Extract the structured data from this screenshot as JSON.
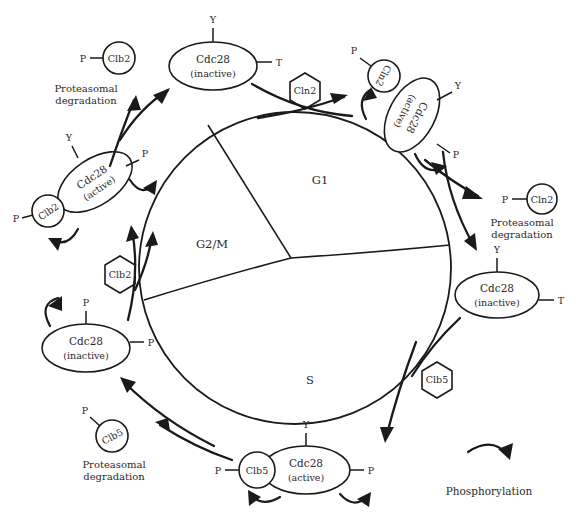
{
  "figure": {
    "ink_color": "#1a1a1a",
    "text_color": "#2a2a2a",
    "background": "#ffffff"
  },
  "cycle": {
    "phases": [
      {
        "label": "G1"
      },
      {
        "label": "S"
      },
      {
        "label": "G2/M"
      }
    ]
  },
  "cyclin_inputs": [
    {
      "label": "Cln2",
      "shape": "hexagon"
    },
    {
      "label": "Clb5",
      "shape": "hexagon"
    },
    {
      "label": "Clb2",
      "shape": "hexagon"
    }
  ],
  "nodes": {
    "g1_inactive_cdc28": {
      "name": "Cdc28",
      "state": "(inactive)",
      "residue_top": "Y",
      "residue_right": "T"
    },
    "g1_active_complex": {
      "name": "Cdc28",
      "state": "(active)",
      "cyclin": "Cln2",
      "cyclin_phosphate": "P",
      "residue_top": "Y",
      "residue_bottom": "P"
    },
    "cln2_degraded": {
      "cyclin": "Cln2",
      "phosphate": "P"
    },
    "s_inactive_cdc28": {
      "name": "Cdc28",
      "state": "(inactive)",
      "residue_top": "Y",
      "residue_right": "T"
    },
    "s_active_complex": {
      "name": "Cdc28",
      "state": "(active)",
      "cyclin": "Clb5",
      "cyclin_phosphate": "P",
      "residue_top": "Y",
      "residue_right": "P"
    },
    "clb5_degraded": {
      "cyclin": "Clb5",
      "phosphate": "P"
    },
    "g2m_inactive_cdc28": {
      "name": "Cdc28",
      "state": "(inactive)",
      "residue_top": "P",
      "residue_right": "P"
    },
    "g2m_active_complex": {
      "name": "Cdc28",
      "state": "(active)",
      "cyclin": "Clb2",
      "cyclin_phosphate": "P",
      "residue_top": "Y",
      "residue_right": "P"
    },
    "clb2_degraded": {
      "cyclin": "Clb2",
      "phosphate": "P"
    }
  },
  "annotations": {
    "degradation_top_left": "Proteasomal\ndegradation",
    "degradation_top_left_line1": "Proteasomal",
    "degradation_top_left_line2": "degradation",
    "degradation_right_line1": "Proteasomal",
    "degradation_right_line2": "degradation",
    "degradation_bottom_line1": "Proteasomal",
    "degradation_bottom_line2": "degradation"
  },
  "legend": {
    "phosphorylation_label": "Phosphorylation",
    "icon": "curved-hook-arrow"
  }
}
